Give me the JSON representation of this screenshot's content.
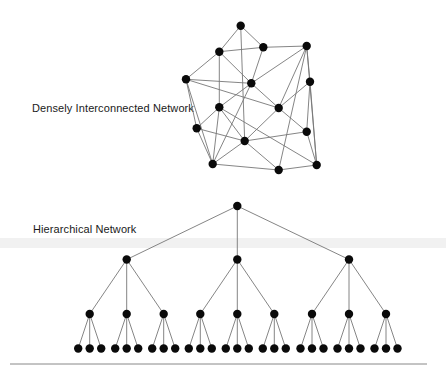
{
  "labels": {
    "dense": "Densely Interconnected Network",
    "hierarchical": "Hierarchical Network"
  },
  "colors": {
    "node": "#0a0a0a",
    "edge": "#777777",
    "band": "#ececec",
    "rule": "#888888"
  },
  "dense_network": {
    "nodes": {
      "A": [
        240.7,
        25.7
      ],
      "B": [
        219.3,
        51.7
      ],
      "C": [
        263.3,
        47.3
      ],
      "D": [
        306.7,
        46.0
      ],
      "E": [
        186.0,
        79.3
      ],
      "F": [
        251.3,
        83.3
      ],
      "G": [
        310.0,
        81.7
      ],
      "H": [
        219.3,
        107.3
      ],
      "I": [
        278.7,
        108.0
      ],
      "J": [
        196.7,
        128.3
      ],
      "K": [
        306.7,
        131.7
      ],
      "L": [
        244.7,
        141.0
      ],
      "M": [
        212.7,
        164.0
      ],
      "N": [
        278.7,
        170.0
      ],
      "O": [
        316.7,
        165.0
      ]
    },
    "edges": [
      [
        "A",
        "B"
      ],
      [
        "A",
        "C"
      ],
      [
        "A",
        "L"
      ],
      [
        "B",
        "C"
      ],
      [
        "B",
        "E"
      ],
      [
        "B",
        "F"
      ],
      [
        "B",
        "H"
      ],
      [
        "C",
        "D"
      ],
      [
        "C",
        "F"
      ],
      [
        "D",
        "F"
      ],
      [
        "D",
        "G"
      ],
      [
        "D",
        "I"
      ],
      [
        "D",
        "N"
      ],
      [
        "D",
        "O"
      ],
      [
        "E",
        "F"
      ],
      [
        "E",
        "I"
      ],
      [
        "E",
        "J"
      ],
      [
        "E",
        "M"
      ],
      [
        "F",
        "H"
      ],
      [
        "F",
        "I"
      ],
      [
        "F",
        "M"
      ],
      [
        "G",
        "I"
      ],
      [
        "G",
        "K"
      ],
      [
        "G",
        "O"
      ],
      [
        "H",
        "J"
      ],
      [
        "H",
        "L"
      ],
      [
        "H",
        "M"
      ],
      [
        "H",
        "O"
      ],
      [
        "I",
        "L"
      ],
      [
        "I",
        "K"
      ],
      [
        "J",
        "L"
      ],
      [
        "J",
        "M"
      ],
      [
        "K",
        "L"
      ],
      [
        "K",
        "O"
      ],
      [
        "L",
        "M"
      ],
      [
        "L",
        "N"
      ],
      [
        "M",
        "N"
      ],
      [
        "N",
        "O"
      ]
    ]
  },
  "hierarchical_network": {
    "root": [
      237.3,
      206
    ],
    "level1_y": 259.5,
    "level1_x": [
      126.7,
      237.3,
      349.0
    ],
    "level2_y": 314,
    "level2_offsets": [
      -37,
      0,
      37
    ],
    "level3_y": 348.5,
    "level3_offsets": [
      -11.5,
      0,
      11.5
    ],
    "branching": 3
  },
  "bottom_rule": {
    "x1": 10,
    "x2": 427,
    "y": 364
  }
}
